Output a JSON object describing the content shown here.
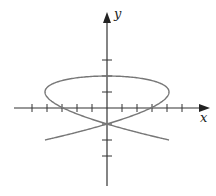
{
  "diagram": {
    "type": "parametric-curve",
    "axes": {
      "x_label": "x",
      "y_label": "y",
      "origin": [
        107,
        108
      ],
      "tick_spacing_px": 15,
      "x_ticks_each_side": 5,
      "y_ticks_each_side": 3
    },
    "curve": {
      "description": "Lissajous curve",
      "x_amplitude_px": 62,
      "y_amplitude_px": 32,
      "x_frequency": 3,
      "y_frequency": 2,
      "color": "#777777"
    },
    "colors": {
      "axis": "#333333",
      "curve": "#777777"
    }
  }
}
